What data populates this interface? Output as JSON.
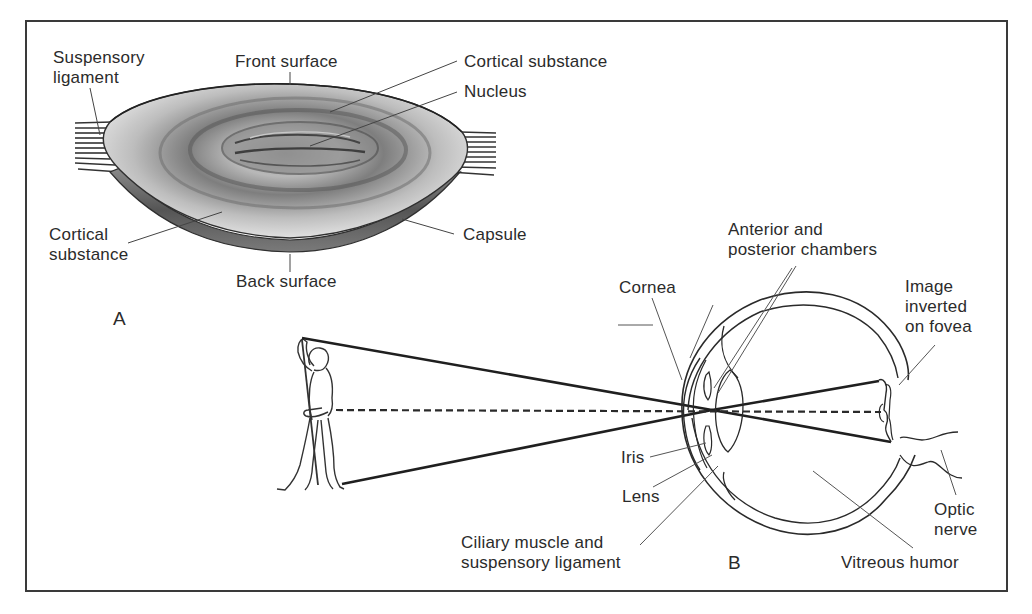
{
  "figure": {
    "panels": [
      {
        "id": "A",
        "letter": "A",
        "subject": "Crystalline lens cross-section",
        "labels": {
          "suspensory_ligament": "Suspensory\nligament",
          "front_surface": "Front surface",
          "cortical_substance_top": "Cortical substance",
          "nucleus": "Nucleus",
          "cortical_substance_bottom": "Cortical\nsubstance",
          "capsule": "Capsule",
          "back_surface": "Back surface"
        }
      },
      {
        "id": "B",
        "letter": "B",
        "subject": "Eye forming inverted image of a standing figure",
        "labels": {
          "anterior_posterior_chambers": "Anterior and\nposterior chambers",
          "cornea": "Cornea",
          "image_inverted": "Image\ninverted\non fovea",
          "iris": "Iris",
          "lens": "Lens",
          "ciliary_muscle": "Ciliary muscle and\nsuspensory ligament",
          "vitreous_humor": "Vitreous humor",
          "optic_nerve": "Optic\nnerve"
        }
      }
    ]
  },
  "colors": {
    "ink": "#2b2b2b",
    "frame": "#3a3a3a",
    "lens_dark": "#5a5a5a",
    "lens_light": "#e4e4e4"
  }
}
